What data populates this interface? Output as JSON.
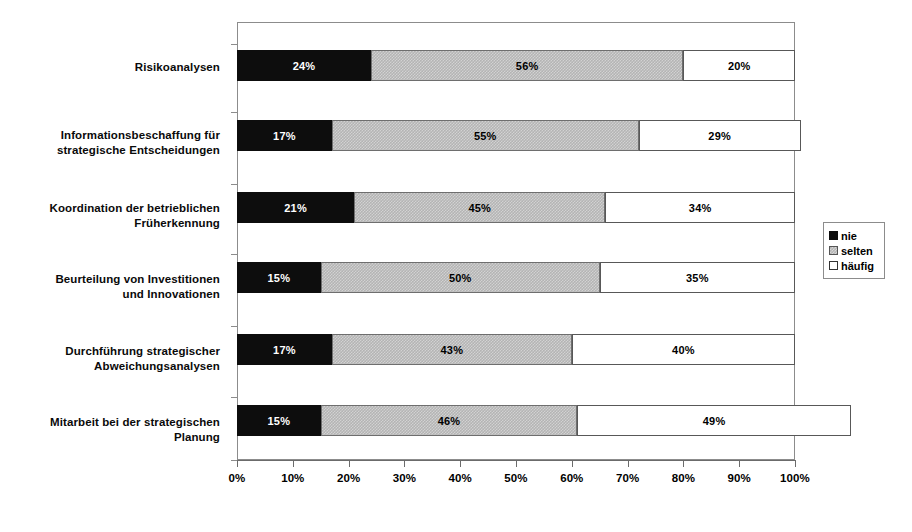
{
  "chart_data": {
    "type": "bar",
    "orientation": "horizontal",
    "stacked": true,
    "stack_mode": "percent",
    "title": "",
    "subtitle": "",
    "xlabel": "",
    "ylabel": "",
    "xlim": [
      0,
      100
    ],
    "grid": false,
    "legend_position": "right",
    "categories": [
      "Risikoanalysen",
      "Informationsbeschaffung für strategische Entscheidungen",
      "Koordination der betrieblichen Früherkennung",
      "Beurteilung von Investitionen und Innovationen",
      "Durchführung strategischer Abweichungsanalysen",
      "Mitarbeit bei der strategischen Planung"
    ],
    "category_lines": [
      [
        "Risikoanalysen"
      ],
      [
        "Informationsbeschaffung für",
        "strategische Entscheidungen"
      ],
      [
        "Koordination der betrieblichen",
        "Früherkennung"
      ],
      [
        "Beurteilung von Investitionen",
        "und Innovationen"
      ],
      [
        "Durchführung strategischer",
        "Abweichungsanalysen"
      ],
      [
        "Mitarbeit bei der strategischen",
        "Planung"
      ]
    ],
    "series": [
      {
        "name": "nie",
        "color": "#0d0d0d",
        "values": [
          24,
          17,
          21,
          15,
          17,
          15
        ]
      },
      {
        "name": "selten",
        "color": "#b4b4b4",
        "values": [
          56,
          55,
          45,
          50,
          43,
          46
        ]
      },
      {
        "name": "häufig",
        "color": "#ffffff",
        "values": [
          20,
          29,
          34,
          35,
          40,
          49
        ]
      }
    ],
    "data_labels": [
      [
        "24%",
        "56%",
        "20%"
      ],
      [
        "17%",
        "55%",
        "29%"
      ],
      [
        "21%",
        "45%",
        "34%"
      ],
      [
        "15%",
        "50%",
        "35%"
      ],
      [
        "17%",
        "43%",
        "40%"
      ],
      [
        "15%",
        "46%",
        "49%"
      ]
    ],
    "xticks": [
      0,
      10,
      20,
      30,
      40,
      50,
      60,
      70,
      80,
      90,
      100
    ],
    "xtick_labels": [
      "0%",
      "10%",
      "20%",
      "30%",
      "40%",
      "50%",
      "60%",
      "70%",
      "80%",
      "90%",
      "100%"
    ]
  },
  "legend": {
    "items": [
      {
        "label": "nie",
        "swatch": "black-swatch"
      },
      {
        "label": "selten",
        "swatch": "gray-hatch-swatch"
      },
      {
        "label": "häufig",
        "swatch": "white-swatch"
      }
    ]
  }
}
